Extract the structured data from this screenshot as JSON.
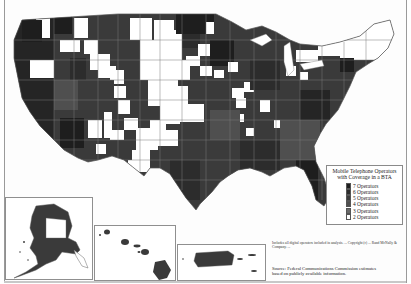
{
  "map": {
    "title_cropped": "",
    "subject": "Mobile telephone operators with coverage per Basic Trading Area (BTA), United States",
    "colors": {
      "background": "#ffffff",
      "border": "#6e6e6e",
      "ops7": "#1e1e1e",
      "ops6": "#2c2c2c",
      "ops5": "#3b3b3b",
      "ops4": "#4f4f4f",
      "ops3": "#6a6a6a",
      "ops2": "#ffffff"
    }
  },
  "legend": {
    "title_line1": "Mobile Telephone Operators",
    "title_line2": "with Coverage in a BTA",
    "items": [
      {
        "label": "7 Operators",
        "color": "#1e1e1e"
      },
      {
        "label": "6 Operators",
        "color": "#2c2c2c"
      },
      {
        "label": "5 Operators",
        "color": "#3b3b3b"
      },
      {
        "label": "4 Operators",
        "color": "#4f4f4f"
      },
      {
        "label": "3 Operators",
        "color": "#6a6a6a"
      },
      {
        "label": "2 Operators",
        "color": "#ffffff"
      }
    ]
  },
  "insets": {
    "alaska": {
      "label": "Alaska"
    },
    "hawaii": {
      "label": "Hawaii"
    },
    "puerto_rico": {
      "label": "Puerto Rico"
    }
  },
  "footer": {
    "note": "Includes all digital operators included in analysis. ... Copyright (c) ... Rand McNally & Company. ...",
    "source_line1": "Source: Federal Communications Commission estimates",
    "source_line2": "based on publicly available information."
  }
}
